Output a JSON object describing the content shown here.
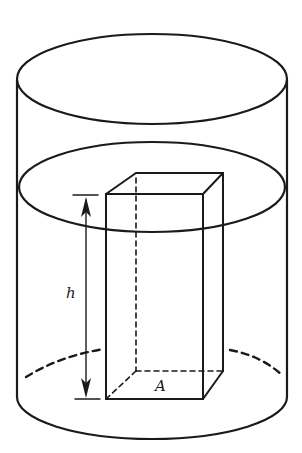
{
  "diagram": {
    "labels": {
      "height": "h",
      "base_area": "A"
    },
    "colors": {
      "stroke": "#1a1a1a",
      "background": "#ffffff"
    }
  }
}
